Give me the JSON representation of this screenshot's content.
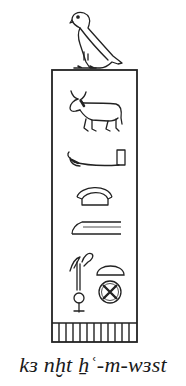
{
  "figure": {
    "type": "serekh",
    "surmount_glyph": "horus-falcon-icon",
    "glyphs": [
      "bull-icon",
      "arm-with-stick-icon",
      "bread-loaf-arch-icon",
      "forearm-icon",
      "plough-figure-icon",
      "half-loaf-icon",
      "city-circle-icon"
    ],
    "facade_stripes": 11,
    "stroke_color": "#222222"
  },
  "caption": {
    "text": "kɜ nḫt ẖʿ-m-wɜst"
  }
}
